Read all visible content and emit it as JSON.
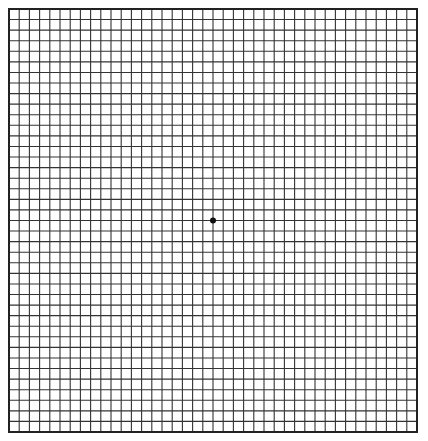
{
  "diagram": {
    "type": "amsler-grid",
    "columns": 40,
    "rows": 40,
    "line_color": "#333333",
    "border_color": "#222222",
    "background": "#ffffff",
    "center_dot": {
      "column": 20,
      "row": 20,
      "color": "#111111"
    }
  }
}
